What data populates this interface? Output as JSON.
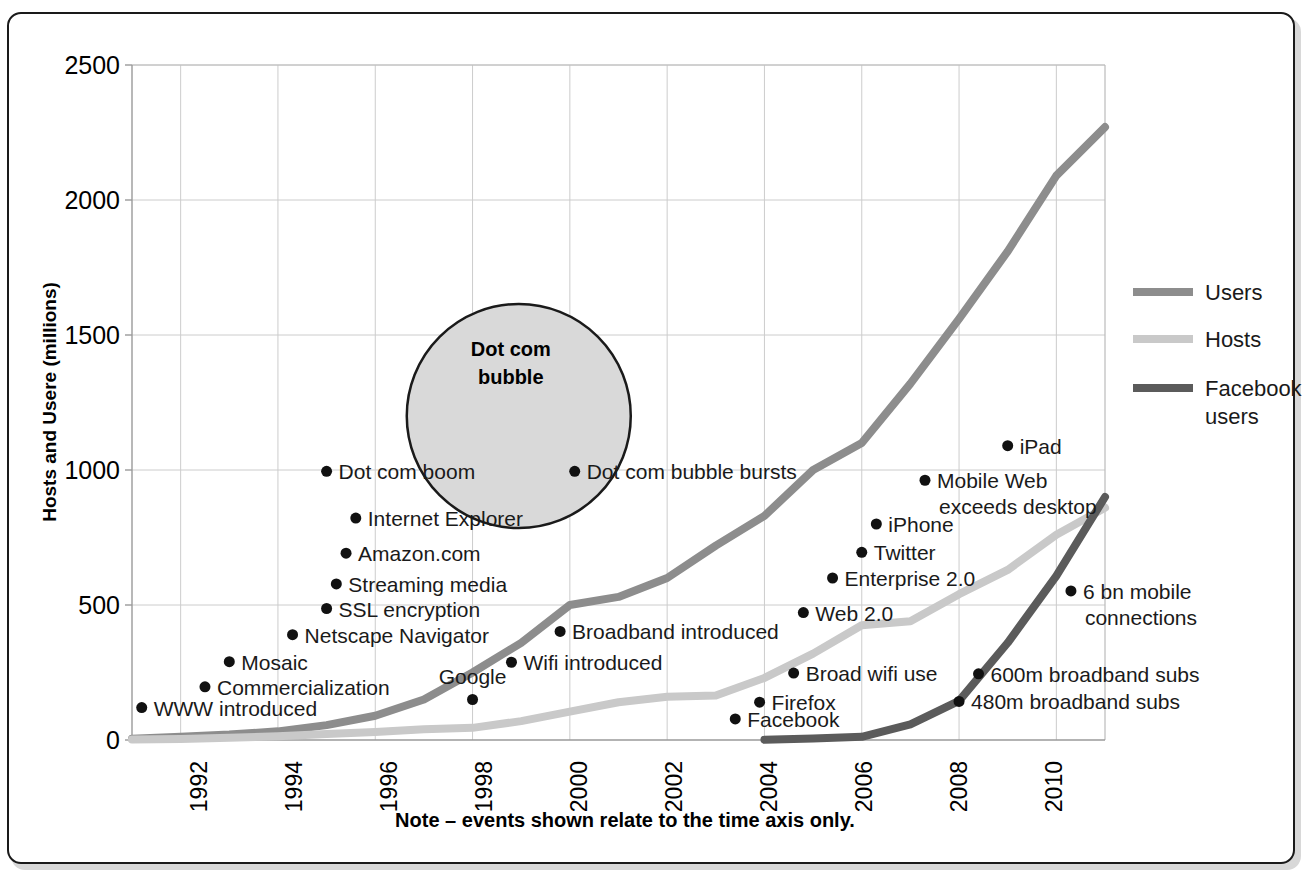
{
  "chart_data": {
    "type": "line",
    "title": "",
    "xlabel": "",
    "ylabel": "Hosts and Usere (millions)",
    "note": "Note – events shown relate to the time axis only.",
    "xlim": [
      1991,
      2011
    ],
    "ylim": [
      0,
      2500
    ],
    "yticks": [
      0,
      500,
      1000,
      1500,
      2000,
      2500
    ],
    "xticks": [
      1992,
      1994,
      1996,
      1998,
      2000,
      2002,
      2004,
      2006,
      2008,
      2010
    ],
    "grid": true,
    "legend_position": "right",
    "series": [
      {
        "name": "Users",
        "color": "#8d8d8d",
        "x": [
          1991,
          1992,
          1993,
          1994,
          1995,
          1996,
          1997,
          1998,
          1999,
          2000,
          2001,
          2002,
          2003,
          2004,
          2005,
          2006,
          2007,
          2008,
          2009,
          2010,
          2011
        ],
        "values": [
          5,
          12,
          20,
          32,
          55,
          90,
          150,
          250,
          360,
          500,
          530,
          600,
          720,
          830,
          1000,
          1100,
          1320,
          1560,
          1810,
          2090,
          2270
        ]
      },
      {
        "name": "Hosts",
        "color": "#c9c9c9",
        "x": [
          1991,
          1992,
          1993,
          1994,
          1995,
          1996,
          1997,
          1998,
          1999,
          2000,
          2001,
          2002,
          2003,
          2004,
          2005,
          2006,
          2007,
          2008,
          2009,
          2010,
          2011
        ],
        "values": [
          2,
          4,
          8,
          14,
          22,
          30,
          40,
          45,
          70,
          105,
          140,
          160,
          165,
          230,
          320,
          425,
          440,
          540,
          630,
          760,
          860
        ]
      },
      {
        "name": "Facebook users",
        "color": "#5b5b5b",
        "x": [
          2004,
          2005,
          2006,
          2007,
          2008,
          2009,
          2010,
          2011
        ],
        "values": [
          1,
          6,
          12,
          58,
          145,
          360,
          608,
          900
        ]
      }
    ],
    "annotations": [
      {
        "label": "WWW introduced",
        "x": 1991.2,
        "y": 120,
        "align": "left"
      },
      {
        "label": "Commercialization",
        "x": 1992.5,
        "y": 197,
        "align": "left"
      },
      {
        "label": "Mosaic",
        "x": 1993.0,
        "y": 290,
        "align": "left"
      },
      {
        "label": "Netscape Navigator",
        "x": 1994.3,
        "y": 390,
        "align": "left"
      },
      {
        "label": "SSL encryption",
        "x": 1995.0,
        "y": 487,
        "align": "left"
      },
      {
        "label": "Streaming media",
        "x": 1995.2,
        "y": 578,
        "align": "left"
      },
      {
        "label": "Amazon.com",
        "x": 1995.4,
        "y": 692,
        "align": "left"
      },
      {
        "label": "Internet Explorer",
        "x": 1995.6,
        "y": 822,
        "align": "left"
      },
      {
        "label": "Dot com boom",
        "x": 1995.0,
        "y": 995,
        "align": "left"
      },
      {
        "label": "Dot com bubble bursts",
        "x": 2000.1,
        "y": 995,
        "align": "left"
      },
      {
        "label": "Broadband introduced",
        "x": 1999.8,
        "y": 402,
        "align": "left"
      },
      {
        "label": "Wifi introduced",
        "x": 1998.8,
        "y": 288,
        "align": "left"
      },
      {
        "label": "Google",
        "x": 1998.0,
        "y": 150,
        "align": "above"
      },
      {
        "label": "Facebook",
        "x": 2003.4,
        "y": 78,
        "align": "left"
      },
      {
        "label": "Firefox",
        "x": 2003.9,
        "y": 140,
        "align": "left"
      },
      {
        "label": "Broad wifi use",
        "x": 2004.6,
        "y": 248,
        "align": "left"
      },
      {
        "label": "Web 2.0",
        "x": 2004.8,
        "y": 472,
        "align": "left"
      },
      {
        "label": "Enterprise 2.0",
        "x": 2005.4,
        "y": 600,
        "align": "left"
      },
      {
        "label": "Twitter",
        "x": 2006.0,
        "y": 695,
        "align": "left"
      },
      {
        "label": "iPhone",
        "x": 2006.3,
        "y": 800,
        "align": "left"
      },
      {
        "label": "Mobile Web",
        "x": 2007.3,
        "y": 962,
        "align": "left"
      },
      {
        "label": "exceeds desktop",
        "x": 2007.3,
        "y": 962,
        "align": "second-line"
      },
      {
        "label": "iPad",
        "x": 2009.0,
        "y": 1090,
        "align": "left"
      },
      {
        "label": "6 bn mobile",
        "x": 2010.3,
        "y": 552,
        "align": "left"
      },
      {
        "label": "connections",
        "x": 2010.3,
        "y": 552,
        "align": "second-line"
      },
      {
        "label": "600m broadband subs",
        "x": 2008.4,
        "y": 245,
        "align": "left"
      },
      {
        "label": "480m broadband subs",
        "x": 2008.0,
        "y": 143,
        "align": "left"
      }
    ],
    "bubble": {
      "title_line1": "Dot com",
      "title_line2": "bubble",
      "center_x": 1998.95,
      "center_y": 1200,
      "fill": "#d9d9d9",
      "stroke": "#1a1a1a"
    }
  },
  "legend": {
    "items": [
      {
        "label": "Users",
        "color": "#8d8d8d"
      },
      {
        "label": "Hosts",
        "color": "#c9c9c9"
      },
      {
        "label": "Facebook",
        "label2": "users",
        "color": "#5b5b5b"
      }
    ]
  },
  "ylabel_text": "Hosts and Usere (millions)",
  "note_text": "Note – events shown relate to the time axis only.",
  "ytick_0": "0",
  "ytick_500": "500",
  "ytick_1000": "1000",
  "ytick_1500": "1500",
  "ytick_2000": "2000",
  "ytick_2500": "2500",
  "xtick_1992": "1992",
  "xtick_1994": "1994",
  "xtick_1996": "1996",
  "xtick_1998": "1998",
  "xtick_2000": "2000",
  "xtick_2002": "2002",
  "xtick_2004": "2004",
  "xtick_2006": "2006",
  "xtick_2008": "2008",
  "xtick_2010": "2010",
  "legend_users": "Users",
  "legend_hosts": "Hosts",
  "legend_fb1": "Facebook",
  "legend_fb2": "users",
  "bubble_l1": "Dot com",
  "bubble_l2": "bubble"
}
